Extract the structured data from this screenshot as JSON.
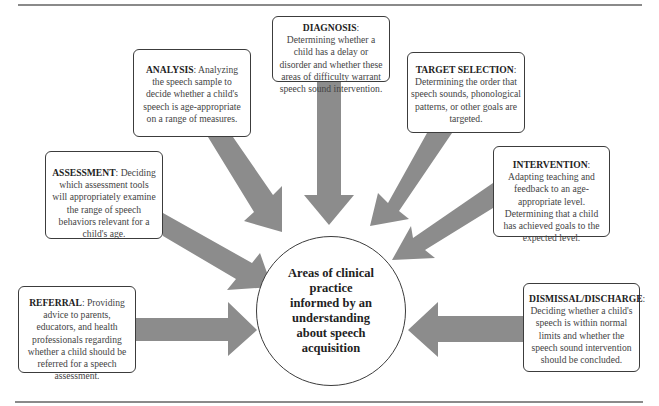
{
  "diagram": {
    "center": {
      "text": "Areas of clinical practice informed by an understanding about speech acquisition"
    },
    "nodes": [
      {
        "id": "diagnosis",
        "title": "DIAGNOSIS",
        "text": "Determining whether a child has a delay or disorder and whether these areas of difficulty warrant speech sound intervention."
      },
      {
        "id": "analysis",
        "title": "ANALYSIS",
        "text": "Analyzing the speech sample to decide whether a child's speech is age-appropriate on a range of measures."
      },
      {
        "id": "target-selection",
        "title": "TARGET SELECTION",
        "text": "Determining the order that speech sounds, phonological patterns, or other goals are targeted."
      },
      {
        "id": "assessment",
        "title": "ASSESSMENT",
        "text": "Deciding which assessment tools will appropriately examine the range of speech behaviors relevant for a child's age."
      },
      {
        "id": "intervention",
        "title": "INTERVENTION",
        "text": "Adapting teaching and feedback to an age-appropriate level. Determining that a child has achieved goals to the expected level."
      },
      {
        "id": "referral",
        "title": "REFERRAL",
        "text": "Providing advice to parents, educators, and health professionals regarding whether a child should be referred for a speech assessment."
      },
      {
        "id": "dismissal-discharge",
        "title": "DISMISSAL/DISCHARGE",
        "text": "Deciding whether a child's speech is within normal limits and whether the speech sound intervention should be concluded."
      }
    ],
    "colors": {
      "arrow": "#8c8c8c",
      "border": "#3c3c3c",
      "rule": "#8a8a8a"
    }
  }
}
